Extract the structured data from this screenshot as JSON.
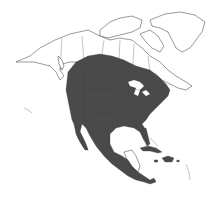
{
  "map": {
    "region": "North America",
    "type": "species range map",
    "colors": {
      "background": "#ffffff",
      "land": "#ffffff",
      "outline": "#333333",
      "range_fill": "#4a4a4a"
    },
    "range": {
      "description": "Shaded range covering central/southern Canada prairies, most of the contiguous United States, Mexico and Central America, and the Greater Antilles"
    }
  }
}
